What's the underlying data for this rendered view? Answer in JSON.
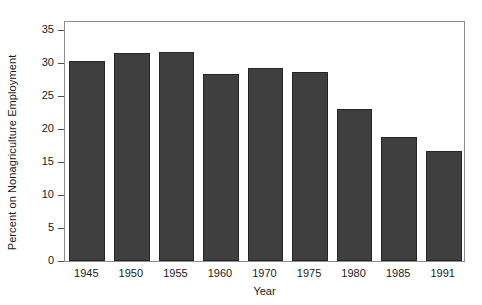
{
  "chart_data": {
    "type": "bar",
    "title": "",
    "xlabel": "Year",
    "ylabel": "Percent on Nonagriculture Employment",
    "categories": [
      "1945",
      "1950",
      "1955",
      "1960",
      "1970",
      "1975",
      "1980",
      "1985",
      "1991"
    ],
    "values": [
      30.3,
      31.5,
      31.7,
      28.4,
      29.3,
      28.7,
      23.1,
      18.8,
      16.7
    ],
    "ylim": [
      0,
      35
    ],
    "yticks": [
      0,
      5,
      10,
      15,
      20,
      25,
      30,
      35
    ],
    "ytick_labels": [
      "0",
      "5",
      "10",
      "15",
      "20",
      "25",
      "30",
      "35"
    ],
    "grid": false,
    "legend": null,
    "bar_color": "#3f3f3f",
    "bar_edge_color": "#262626",
    "frame_color": "#8c8c8c",
    "background_color": "#ffffff"
  }
}
